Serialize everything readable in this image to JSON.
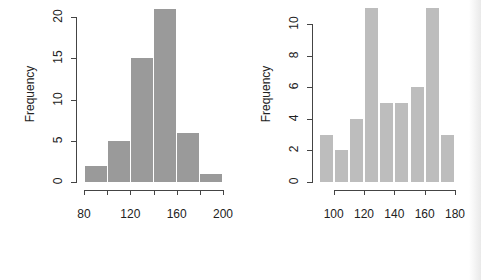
{
  "chart_data": [
    {
      "type": "bar",
      "title": "",
      "xlabel": "",
      "ylabel": "Frequency",
      "bins": [
        [
          80,
          100
        ],
        [
          100,
          120
        ],
        [
          120,
          140
        ],
        [
          140,
          160
        ],
        [
          160,
          180
        ],
        [
          180,
          200
        ]
      ],
      "categories": [
        "80-100",
        "100-120",
        "120-140",
        "140-160",
        "160-180",
        "180-200"
      ],
      "values": [
        2,
        5,
        15,
        21,
        6,
        1
      ],
      "xticks": [
        "80",
        "120",
        "160",
        "200"
      ],
      "xtick_values": [
        80,
        100,
        120,
        140,
        160,
        180,
        200
      ],
      "yticks": [
        "0",
        "5",
        "10",
        "15",
        "20"
      ],
      "xlim": [
        80,
        200
      ],
      "ylim": [
        0,
        21
      ],
      "bar_color": "#9a9a9a",
      "grid": false,
      "legend": null
    },
    {
      "type": "bar",
      "title": "",
      "xlabel": "",
      "ylabel": "Frequency",
      "bins": [
        [
          90,
          100
        ],
        [
          100,
          110
        ],
        [
          110,
          120
        ],
        [
          120,
          130
        ],
        [
          130,
          140
        ],
        [
          140,
          150
        ],
        [
          150,
          160
        ],
        [
          160,
          170
        ],
        [
          170,
          180
        ]
      ],
      "categories": [
        "90-100",
        "100-110",
        "110-120",
        "120-130",
        "130-140",
        "140-150",
        "150-160",
        "160-170",
        "170-180"
      ],
      "values": [
        3,
        2,
        4,
        11,
        5,
        5,
        6,
        11,
        3
      ],
      "xticks": [
        "100",
        "120",
        "140",
        "160",
        "180"
      ],
      "xtick_values": [
        100,
        120,
        140,
        160,
        180
      ],
      "yticks": [
        "0",
        "2",
        "4",
        "6",
        "8",
        "10"
      ],
      "xlim": [
        90,
        180
      ],
      "ylim": [
        0,
        11
      ],
      "bar_color": "#bdbdbd",
      "grid": false,
      "legend": null
    }
  ]
}
